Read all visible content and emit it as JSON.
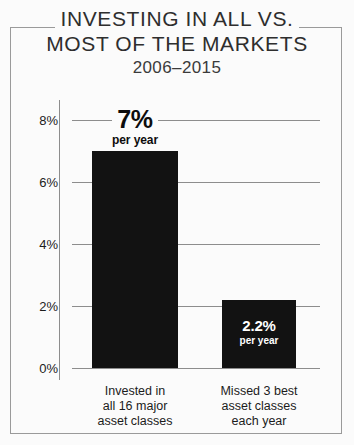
{
  "chart_data": {
    "type": "bar",
    "title": "INVESTING IN ALL VS. MOST OF THE MARKETS",
    "title_line_1": "INVESTING IN ALL VS.",
    "title_line_2": "MOST OF THE MARKETS",
    "subtitle": "2006–2015",
    "xlabel": "",
    "ylabel": "",
    "ylim": [
      0,
      8
    ],
    "grid": true,
    "legend": "none",
    "categories": [
      "Invested in all 16 major asset classes",
      "Missed 3 best asset classes each year"
    ],
    "category_lines": [
      [
        "Invested in",
        "all 16 major",
        "asset classes"
      ],
      [
        "Missed 3 best",
        "asset classes",
        "each year"
      ]
    ],
    "values": [
      7.0,
      2.2
    ],
    "value_labels": [
      "7%",
      "2.2%"
    ],
    "value_sublabels": [
      "per year",
      "per year"
    ],
    "ytick_labels": [
      "0%",
      "2%",
      "4%",
      "6%",
      "8%"
    ],
    "ytick_values": [
      0,
      2,
      4,
      6,
      8
    ],
    "colors": {
      "bar": "#121212",
      "background": "#fbfbfb",
      "gridline": "#8d8d8d",
      "frame": "#9a9a9a",
      "text": "#1c1c1c",
      "inside_label": "#ffffff"
    }
  }
}
